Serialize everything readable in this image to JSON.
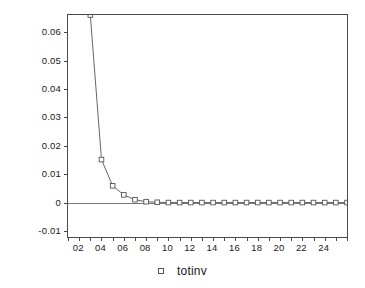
{
  "chart_data": {
    "type": "line",
    "title": "",
    "xlabel": "",
    "ylabel": "",
    "xlim": [
      1,
      26
    ],
    "ylim": [
      -0.012,
      0.066
    ],
    "grid": false,
    "legend_position": "bottom-center",
    "zero_reference_line": 0,
    "y_ticks": [
      0.06,
      0.05,
      0.04,
      0.03,
      0.02,
      0.01,
      0,
      -0.01
    ],
    "y_tick_labels": [
      "0.06",
      "0.05",
      "0.04",
      "0.03",
      "0.02",
      "0.01",
      "0",
      "-0.01"
    ],
    "x_ticks": [
      2,
      4,
      6,
      8,
      10,
      12,
      14,
      16,
      18,
      20,
      22,
      24
    ],
    "x_tick_labels": [
      "02",
      "04",
      "06",
      "08",
      "10",
      "12",
      "14",
      "16",
      "18",
      "20",
      "22",
      "24"
    ],
    "x_minor_tick_step": 1,
    "series": [
      {
        "name": "totinv",
        "marker": "open-square",
        "line_color": "#555555",
        "marker_color": "#555555",
        "x": [
          2,
          3,
          4,
          5,
          6,
          7,
          8,
          9,
          10,
          11,
          12,
          13,
          14,
          15,
          16,
          17,
          18,
          19,
          20,
          21,
          22,
          23,
          24,
          25,
          26
        ],
        "values": [
          0.195,
          0.066,
          0.0152,
          0.006,
          0.0028,
          0.0011,
          0.0004,
          0.0002,
          0.0001,
          0.0001,
          0.0001,
          0.0001,
          0.0001,
          0.0001,
          0.0001,
          0.0001,
          0.0001,
          0.0001,
          0.0001,
          0.0001,
          0.0001,
          0.0001,
          0.0001,
          0.0001,
          0.0001
        ],
        "clipped_above_axis": true
      }
    ],
    "legend": [
      {
        "label": "totinv",
        "marker": "open-square"
      }
    ]
  },
  "legend": {
    "marker_name": "open-square-marker",
    "label": "totinv"
  }
}
